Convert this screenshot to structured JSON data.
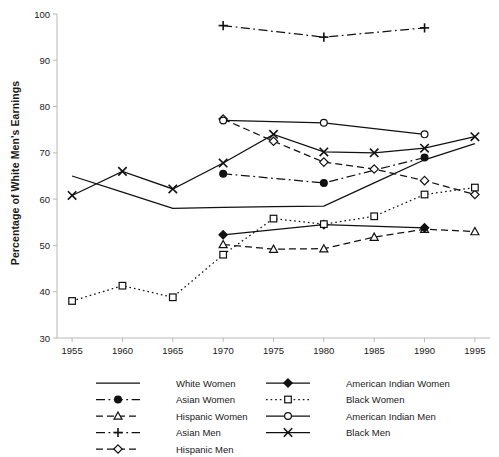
{
  "chart_data": {
    "type": "line",
    "title": "",
    "xlabel": "",
    "ylabel": "Percentage of White Men's Earnings",
    "x": [
      1955,
      1960,
      1965,
      1970,
      1975,
      1980,
      1985,
      1990,
      1995
    ],
    "xlim": [
      1953.5,
      1996.5
    ],
    "ylim": [
      30,
      100
    ],
    "xticks": [
      "1955",
      "1960",
      "1965",
      "1970",
      "1975",
      "1980",
      "1985",
      "1990",
      "1995"
    ],
    "yticks": [
      "30",
      "40",
      "50",
      "60",
      "70",
      "80",
      "90",
      "100"
    ],
    "grid": false,
    "legend_position": "bottom",
    "series": [
      {
        "name": "White Women",
        "marker": "none",
        "dash": "solid",
        "x": [
          1955,
          1960,
          1965,
          1970,
          1975,
          1980,
          1985,
          1990,
          1995
        ],
        "values": [
          65.0,
          61.5,
          58.0,
          58.2,
          58.4,
          58.5,
          63.5,
          68.5,
          72.0
        ]
      },
      {
        "name": "Asian Women",
        "marker": "filled-circle",
        "dash": "dash-dot",
        "x": [
          1970,
          1980,
          1990
        ],
        "values": [
          65.5,
          63.5,
          69.0
        ]
      },
      {
        "name": "Hispanic Women",
        "marker": "open-triangle",
        "dash": "dashed",
        "x": [
          1970,
          1975,
          1980,
          1985,
          1990,
          1995
        ],
        "values": [
          50.2,
          49.2,
          49.3,
          51.8,
          53.5,
          53.0
        ]
      },
      {
        "name": "Asian Men",
        "marker": "plus",
        "dash": "dash-dot",
        "x": [
          1970,
          1980,
          1990
        ],
        "values": [
          97.5,
          95.0,
          97.0
        ]
      },
      {
        "name": "Hispanic Men",
        "marker": "open-diamond",
        "dash": "dashed",
        "x": [
          1970,
          1975,
          1980,
          1985,
          1990,
          1995
        ],
        "values": [
          77.3,
          72.5,
          68.0,
          66.5,
          64.0,
          61.0
        ]
      },
      {
        "name": "American Indian Women",
        "marker": "filled-diamond",
        "dash": "solid",
        "x": [
          1970,
          1980,
          1990
        ],
        "values": [
          52.3,
          54.5,
          53.8
        ]
      },
      {
        "name": "Black Women",
        "marker": "open-square",
        "dash": "dotted",
        "x": [
          1955,
          1960,
          1965,
          1970,
          1975,
          1980,
          1985,
          1990,
          1995
        ],
        "values": [
          38.0,
          41.3,
          38.8,
          48.0,
          55.8,
          54.6,
          56.3,
          61.0,
          62.5
        ]
      },
      {
        "name": "American Indian Men",
        "marker": "open-circle",
        "dash": "solid",
        "x": [
          1970,
          1980,
          1990
        ],
        "values": [
          77.0,
          76.5,
          74.0
        ]
      },
      {
        "name": "Black Men",
        "marker": "cross-x",
        "dash": "solid",
        "x": [
          1955,
          1960,
          1965,
          1970,
          1975,
          1980,
          1985,
          1990,
          1995
        ],
        "values": [
          60.8,
          66.0,
          62.2,
          67.8,
          74.0,
          70.2,
          70.0,
          71.0,
          73.5
        ]
      }
    ]
  },
  "legend": {
    "column_left": [
      {
        "label": "White Women",
        "key": "White Women"
      },
      {
        "label": "Asian Women",
        "key": "Asian Women"
      },
      {
        "label": "Hispanic Women",
        "key": "Hispanic Women"
      },
      {
        "label": "Asian Men",
        "key": "Asian Men"
      },
      {
        "label": "Hispanic Men",
        "key": "Hispanic Men"
      }
    ],
    "column_right": [
      {
        "label": "American Indian Women",
        "key": "American Indian Women"
      },
      {
        "label": "Black Women",
        "key": "Black Women"
      },
      {
        "label": "American Indian Men",
        "key": "American Indian Men"
      },
      {
        "label": "Black Men",
        "key": "Black Men"
      }
    ]
  },
  "colors": {
    "line": "#111111",
    "axis": "#b8b8b8",
    "text": "#1a1a1a",
    "background": "#ffffff"
  }
}
